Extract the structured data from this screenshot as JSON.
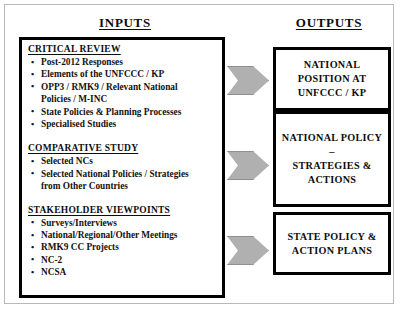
{
  "headers": {
    "inputs": "INPUTS",
    "outputs": "OUTPUTS"
  },
  "inputs": {
    "groups": [
      {
        "title": "CRITICAL REVIEW",
        "bullets": [
          "Post-2012 Responses",
          "Elements of the UNFCCC / KP",
          "OPP3 / RMK9 / Relevant National",
          "State Policies & Planning Processes",
          "Specialised Studies"
        ],
        "continuations": {
          "2": "Policies / M-INC"
        }
      },
      {
        "title": "COMPARATIVE STUDY",
        "bullets": [
          "Selected NCs",
          "Selected National Policies / Strategies"
        ],
        "continuations": {
          "1": "from Other Countries"
        }
      },
      {
        "title": "STAKEHOLDER VIEWPOINTS",
        "bullets": [
          "Surveys/Interviews",
          "National/Regional/Other Meetings",
          "RMK9 CC Projects",
          "NC-2",
          "NCSA"
        ],
        "continuations": {}
      }
    ]
  },
  "outputs": {
    "boxes": [
      {
        "line1": "NATIONAL",
        "line2": "POSITION AT",
        "line3": "UNFCCC / KP"
      },
      {
        "line1": "NATIONAL POLICY –",
        "line2": "STRATEGIES &",
        "line3": "ACTIONS"
      },
      {
        "line1": "STATE POLICY &",
        "line2": "ACTION PLANS",
        "line3": ""
      }
    ]
  },
  "arrows": [
    {
      "name": "arrow-to-national-position"
    },
    {
      "name": "arrow-to-national-policy"
    },
    {
      "name": "arrow-to-state-policy"
    }
  ],
  "colors": {
    "arrow_fill": "#b0b0b0",
    "arrow_stroke": "#8f8f8f",
    "box_border": "#000000",
    "frame_border": "#b9b9b9",
    "text": "#0d0d0d",
    "background": "#ffffff"
  }
}
